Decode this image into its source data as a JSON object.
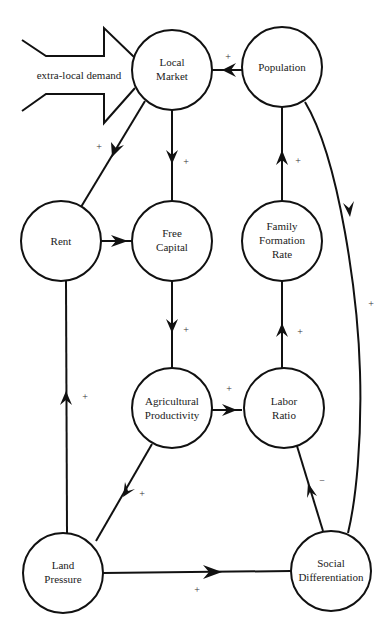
{
  "diagram": {
    "external_input": {
      "label": "extra-local demand"
    },
    "nodes": [
      {
        "id": "local_market",
        "lines": [
          "Local",
          "Market"
        ]
      },
      {
        "id": "population",
        "lines": [
          "Population"
        ]
      },
      {
        "id": "rent",
        "lines": [
          "Rent"
        ]
      },
      {
        "id": "free_capital",
        "lines": [
          "Free",
          "Capital"
        ]
      },
      {
        "id": "family_formation_rate",
        "lines": [
          "Family",
          "Formation",
          "Rate"
        ]
      },
      {
        "id": "agricultural_productivity",
        "lines": [
          "Agricultural",
          "Productivity"
        ]
      },
      {
        "id": "labor_ratio",
        "lines": [
          "Labor",
          "Ratio"
        ]
      },
      {
        "id": "land_pressure",
        "lines": [
          "Land",
          "Pressure"
        ]
      },
      {
        "id": "social_differentiation",
        "lines": [
          "Social",
          "Differentiation"
        ]
      }
    ],
    "edges": [
      {
        "from": "population",
        "to": "local_market",
        "sign": "+"
      },
      {
        "from": "local_market",
        "to": "rent",
        "sign": "+"
      },
      {
        "from": "local_market",
        "to": "free_capital",
        "sign": "+"
      },
      {
        "from": "rent",
        "to": "free_capital",
        "sign": ""
      },
      {
        "from": "free_capital",
        "to": "agricultural_productivity",
        "sign": "+"
      },
      {
        "from": "family_formation_rate",
        "to": "population",
        "sign": "+"
      },
      {
        "from": "population",
        "to": "social_differentiation",
        "sign": "+"
      },
      {
        "from": "labor_ratio",
        "to": "family_formation_rate",
        "sign": "+"
      },
      {
        "from": "agricultural_productivity",
        "to": "labor_ratio",
        "sign": "+"
      },
      {
        "from": "land_pressure",
        "to": "rent",
        "sign": "+"
      },
      {
        "from": "agricultural_productivity",
        "to": "land_pressure",
        "sign": "+"
      },
      {
        "from": "social_differentiation",
        "to": "labor_ratio",
        "sign": "−"
      },
      {
        "from": "land_pressure",
        "to": "social_differentiation",
        "sign": "+"
      }
    ]
  }
}
